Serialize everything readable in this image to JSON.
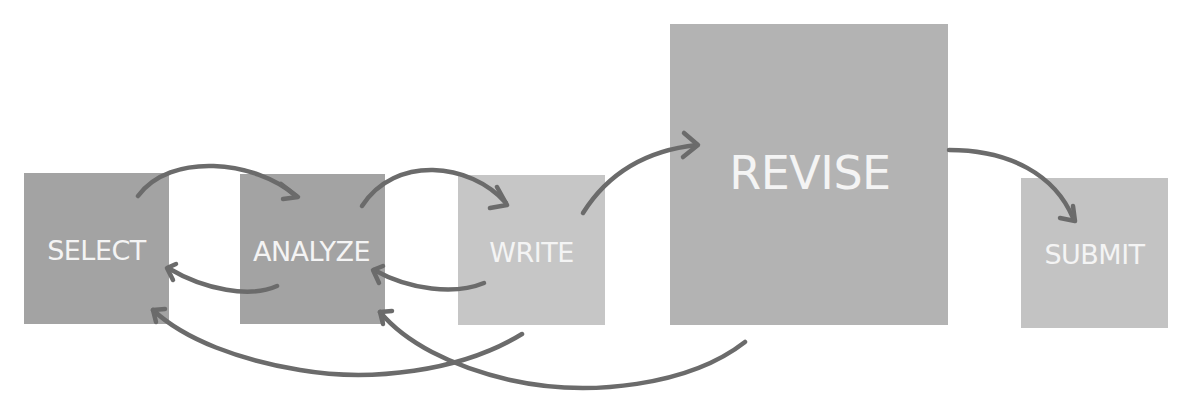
{
  "diagram": {
    "type": "process-flow",
    "nodes": [
      {
        "id": "select",
        "label": "SELECT",
        "color": "#a3a3a3"
      },
      {
        "id": "analyze",
        "label": "ANALYZE",
        "color": "#a3a3a3"
      },
      {
        "id": "write",
        "label": "WRITE",
        "color": "#c6c6c6"
      },
      {
        "id": "revise",
        "label": "REVISE",
        "color": "#b3b3b3"
      },
      {
        "id": "submit",
        "label": "SUBMIT",
        "color": "#c3c3c3"
      }
    ],
    "edges": [
      {
        "from": "select",
        "to": "analyze"
      },
      {
        "from": "analyze",
        "to": "write"
      },
      {
        "from": "write",
        "to": "revise"
      },
      {
        "from": "revise",
        "to": "submit"
      },
      {
        "from": "analyze",
        "to": "select"
      },
      {
        "from": "write",
        "to": "analyze"
      },
      {
        "from": "write",
        "to": "select"
      },
      {
        "from": "revise",
        "to": "analyze"
      }
    ],
    "arrow_color": "#6b6b6b",
    "text_color": "#f4f4f4"
  }
}
